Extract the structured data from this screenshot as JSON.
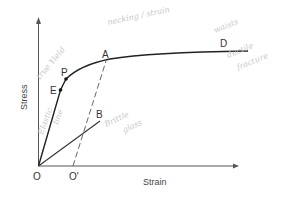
{
  "diagram": {
    "type": "stress-strain curve",
    "axes": {
      "x_label": "Strain",
      "y_label": "Stress"
    },
    "points": {
      "origin": "O",
      "offset_origin": "O'",
      "elastic_limit": "E",
      "proportional_limit": "P",
      "yield_point": "A",
      "ductile_end": "D",
      "brittle_end": "B"
    },
    "annotations": {
      "yield_note": "true Yield",
      "elastic_note": "Elastic",
      "elastic_note2": "line",
      "necking_note": "necking / strain",
      "ductile_note_1": "waists",
      "ductile_note_2": "ductile",
      "ductile_note_3": "fracture",
      "brittle_note_1": "Brittle",
      "brittle_note_2": "glass"
    },
    "colors": {
      "ink": "#222222",
      "axis": "#555555",
      "pencil": "#c8c8c8"
    }
  }
}
